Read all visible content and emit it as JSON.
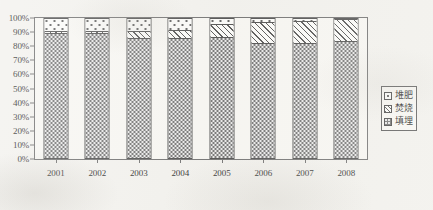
{
  "chart_data": {
    "type": "bar",
    "stacked": true,
    "normalized": "100%",
    "title": "",
    "subtitle": "",
    "xlabel": "",
    "ylabel": "",
    "categories": [
      "2001",
      "2002",
      "2003",
      "2004",
      "2005",
      "2006",
      "2007",
      "2008"
    ],
    "ylim": [
      0,
      100
    ],
    "ytick_labels": [
      "100%",
      "90%",
      "80%",
      "70%",
      "60%",
      "50%",
      "40%",
      "30%",
      "20%",
      "10%",
      "0%"
    ],
    "ytick_values": [
      100,
      90,
      80,
      70,
      60,
      50,
      40,
      30,
      20,
      10,
      0
    ],
    "grid": false,
    "legend_position": "right",
    "series": [
      {
        "name": "填埋",
        "key": "landfill",
        "values": [
          89,
          89.5,
          85.5,
          85.5,
          86,
          82,
          82,
          83.5
        ]
      },
      {
        "name": "焚烧",
        "key": "incineration",
        "values": [
          1.5,
          1.5,
          5,
          6,
          10,
          15,
          16,
          16
        ]
      },
      {
        "name": "堆肥",
        "key": "compost",
        "values": [
          9.5,
          9,
          9.5,
          8.5,
          4,
          3,
          2,
          0.5
        ]
      }
    ]
  },
  "legend": {
    "items": [
      {
        "label": "堆肥",
        "swatch": "compost-swatch-icon"
      },
      {
        "label": "焚烧",
        "swatch": "incineration-swatch-icon"
      },
      {
        "label": "填埋",
        "swatch": "landfill-swatch-icon"
      }
    ]
  }
}
